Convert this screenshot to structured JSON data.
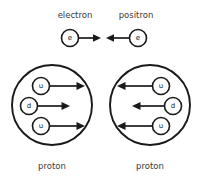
{
  "figure": {
    "background_color": "#ffffff",
    "stroke_color": "#1a1a1a",
    "label_color": "#3a3a3a"
  },
  "top_row": {
    "left_label": "electron",
    "right_label": "positron",
    "left_particle_symbol": "e",
    "right_particle_symbol": "e",
    "left_arrow_direction": "right",
    "right_arrow_direction": "left"
  },
  "bottom_row": {
    "left_caption": "proton",
    "right_caption": "proton",
    "left_proton": {
      "arrow_direction": "right",
      "quarks": [
        {
          "symbol": "u"
        },
        {
          "symbol": "d"
        },
        {
          "symbol": "u"
        }
      ]
    },
    "right_proton": {
      "arrow_direction": "left",
      "quarks": [
        {
          "symbol": "u"
        },
        {
          "symbol": "d"
        },
        {
          "symbol": "u"
        }
      ]
    }
  }
}
